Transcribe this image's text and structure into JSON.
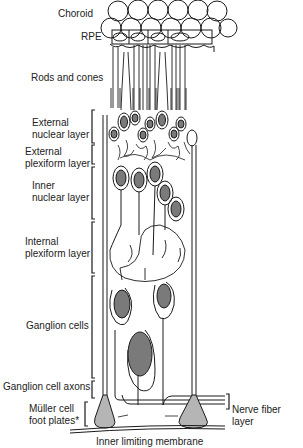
{
  "diagram": {
    "colors": {
      "line": "#1a1a1a",
      "nucleus": "#7a7a7a",
      "foot_plate": "#b5b5b5",
      "background": "#ffffff",
      "text": "#222222"
    },
    "labels": {
      "choroid": "Choroid",
      "rpe": "RPE",
      "rods_and_cones": "Rods and cones",
      "external_nuclear_layer": "External\nnuclear layer",
      "external_plexiform_layer": "External\nplexiform layer",
      "inner_nuclear_layer": "Inner\nnuclear layer",
      "internal_plexiform_layer": "Internal\nplexiform layer",
      "ganglion_cells": "Ganglion cells",
      "ganglion_cell_axons": "Ganglion cell axons",
      "muller_cell_foot_plates": "Müller cell\nfoot plates*",
      "nerve_fiber_layer": "Nerve fiber layer",
      "inner_limiting_membrane": "Inner limiting membrane"
    }
  }
}
